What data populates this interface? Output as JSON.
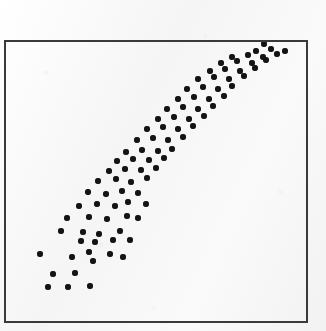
{
  "figure": {
    "width": 326,
    "height": 331,
    "background_color": "#fbfbfb"
  },
  "frame": {
    "name": "plot-frame",
    "left": 4,
    "top": 40,
    "width": 304,
    "height": 283,
    "border_color": "#3a3a3a",
    "border_width": 2
  },
  "marker": {
    "shape": "circle",
    "diameter": 6,
    "color": "#141414"
  },
  "chart_data": {
    "type": "scatter",
    "title": "",
    "subtitle": "",
    "xlabel": "",
    "ylabel": "",
    "grid": false,
    "legend": null,
    "annotations": [],
    "xlim": [
      0,
      100
    ],
    "ylim": [
      0,
      100
    ],
    "axis_ticks": {
      "x": [],
      "y": []
    },
    "relationship": "strong positive linear correlation",
    "n_points": 92,
    "series": [
      {
        "name": "observations",
        "color": "#141414",
        "points": [
          [
            13.8,
            3.5
          ],
          [
            19.8,
            3.4
          ],
          [
            26.4,
            3.6
          ],
          [
            15.6,
            8.0
          ],
          [
            22.0,
            8.2
          ],
          [
            27.4,
            11.8
          ],
          [
            10.6,
            14.4
          ],
          [
            20.4,
            13.4
          ],
          [
            25.5,
            15.0
          ],
          [
            31.6,
            14.2
          ],
          [
            35.6,
            13.2
          ],
          [
            23.6,
            18.3
          ],
          [
            27.8,
            18.0
          ],
          [
            33.2,
            18.6
          ],
          [
            38.2,
            18.5
          ],
          [
            17.9,
            22.0
          ],
          [
            24.5,
            21.6
          ],
          [
            29.2,
            21.0
          ],
          [
            35.5,
            21.8
          ],
          [
            20.2,
            26.4
          ],
          [
            26.6,
            26.8
          ],
          [
            32.0,
            26.0
          ],
          [
            37.8,
            27.0
          ],
          [
            41.0,
            26.2
          ],
          [
            24.0,
            30.4
          ],
          [
            29.4,
            31.0
          ],
          [
            34.6,
            30.2
          ],
          [
            38.4,
            31.6
          ],
          [
            43.6,
            30.8
          ],
          [
            27.2,
            35.6
          ],
          [
            32.4,
            35.0
          ],
          [
            37.0,
            36.0
          ],
          [
            41.8,
            35.2
          ],
          [
            30.0,
            39.8
          ],
          [
            35.2,
            40.4
          ],
          [
            39.6,
            39.2
          ],
          [
            44.4,
            40.6
          ],
          [
            33.4,
            44.0
          ],
          [
            38.0,
            44.8
          ],
          [
            42.8,
            44.2
          ],
          [
            47.2,
            45.0
          ],
          [
            36.2,
            48.6
          ],
          [
            40.8,
            49.4
          ],
          [
            45.6,
            48.8
          ],
          [
            50.0,
            49.6
          ],
          [
            39.0,
            53.0
          ],
          [
            43.8,
            53.8
          ],
          [
            48.4,
            53.2
          ],
          [
            52.6,
            54.0
          ],
          [
            42.2,
            57.6
          ],
          [
            46.8,
            58.2
          ],
          [
            51.4,
            57.4
          ],
          [
            55.8,
            58.4
          ],
          [
            45.0,
            62.0
          ],
          [
            49.6,
            62.6
          ],
          [
            54.2,
            61.8
          ],
          [
            58.6,
            62.8
          ],
          [
            48.2,
            66.2
          ],
          [
            52.8,
            66.8
          ],
          [
            57.4,
            66.0
          ],
          [
            61.8,
            67.0
          ],
          [
            51.0,
            70.4
          ],
          [
            55.6,
            71.0
          ],
          [
            60.2,
            70.2
          ],
          [
            64.6,
            71.2
          ],
          [
            54.4,
            74.6
          ],
          [
            59.0,
            75.2
          ],
          [
            63.6,
            74.4
          ],
          [
            68.0,
            75.4
          ],
          [
            57.2,
            78.8
          ],
          [
            61.8,
            79.4
          ],
          [
            66.4,
            78.6
          ],
          [
            70.8,
            79.6
          ],
          [
            60.6,
            83.0
          ],
          [
            65.2,
            83.6
          ],
          [
            69.8,
            82.8
          ],
          [
            74.2,
            83.8
          ],
          [
            64.0,
            86.8
          ],
          [
            68.6,
            87.4
          ],
          [
            73.2,
            86.6
          ],
          [
            77.6,
            87.6
          ],
          [
            67.4,
            90.4
          ],
          [
            72.0,
            91.0
          ],
          [
            76.6,
            90.2
          ],
          [
            81.0,
            91.2
          ],
          [
            70.8,
            93.4
          ],
          [
            75.4,
            94.0
          ],
          [
            80.0,
            93.2
          ],
          [
            84.4,
            94.2
          ],
          [
            78.2,
            96.4
          ],
          [
            82.8,
            97.0
          ],
          [
            87.0,
            96.2
          ],
          [
            80.6,
            99.0
          ]
        ],
        "pixel_points": [
          [
            48,
            287
          ],
          [
            68,
            287
          ],
          [
            90,
            286
          ],
          [
            53,
            274
          ],
          [
            75,
            273
          ],
          [
            93,
            261
          ],
          [
            40,
            254
          ],
          [
            72,
            257
          ],
          [
            89,
            252
          ],
          [
            110,
            254
          ],
          [
            123,
            257
          ],
          [
            81,
            241
          ],
          [
            95,
            242
          ],
          [
            113,
            240
          ],
          [
            130,
            240
          ],
          [
            61,
            231
          ],
          [
            83,
            232
          ],
          [
            99,
            234
          ],
          [
            120,
            231
          ],
          [
            67,
            218
          ],
          [
            89,
            217
          ],
          [
            107,
            219
          ],
          [
            127,
            216
          ],
          [
            138,
            218
          ],
          [
            79,
            206
          ],
          [
            97,
            204
          ],
          [
            115,
            206
          ],
          [
            128,
            202
          ],
          [
            146,
            204
          ],
          [
            88,
            192
          ],
          [
            106,
            194
          ],
          [
            122,
            191
          ],
          [
            138,
            193
          ],
          [
            98,
            181
          ],
          [
            116,
            179
          ],
          [
            131,
            182
          ],
          [
            147,
            178
          ],
          [
            109,
            171
          ],
          [
            125,
            169
          ],
          [
            141,
            170
          ],
          [
            156,
            168
          ],
          [
            117,
            161
          ],
          [
            133,
            159
          ],
          [
            149,
            160
          ],
          [
            164,
            158
          ],
          [
            126,
            152
          ],
          [
            142,
            150
          ],
          [
            158,
            151
          ],
          [
            172,
            149
          ],
          [
            137,
            140
          ],
          [
            153,
            138
          ],
          [
            168,
            140
          ],
          [
            183,
            137
          ],
          [
            147,
            129
          ],
          [
            163,
            127
          ],
          [
            178,
            129
          ],
          [
            193,
            126
          ],
          [
            158,
            119
          ],
          [
            174,
            117
          ],
          [
            189,
            119
          ],
          [
            204,
            116
          ],
          [
            167,
            109
          ],
          [
            183,
            107
          ],
          [
            198,
            109
          ],
          [
            213,
            106
          ],
          [
            178,
            99
          ],
          [
            194,
            97
          ],
          [
            209,
            99
          ],
          [
            224,
            96
          ],
          [
            187,
            89
          ],
          [
            203,
            87
          ],
          [
            218,
            89
          ],
          [
            232,
            86
          ],
          [
            198,
            79
          ],
          [
            214,
            77
          ],
          [
            229,
            79
          ],
          [
            244,
            76
          ],
          [
            210,
            71
          ],
          [
            225,
            69
          ],
          [
            240,
            71
          ],
          [
            255,
            68
          ],
          [
            221,
            63
          ],
          [
            237,
            61
          ],
          [
            252,
            63
          ],
          [
            266,
            60
          ],
          [
            232,
            57
          ],
          [
            248,
            55
          ],
          [
            263,
            57
          ],
          [
            277,
            54
          ],
          [
            256,
            51
          ],
          [
            271,
            49
          ],
          [
            285,
            51
          ],
          [
            264,
            44
          ]
        ]
      }
    ]
  }
}
